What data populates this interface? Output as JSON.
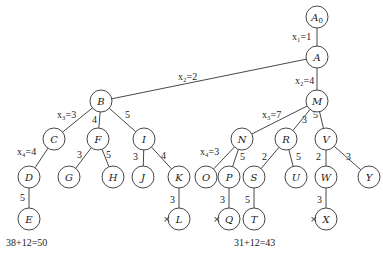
{
  "diagram": {
    "type": "search-tree",
    "nodes": [
      {
        "id": "A0",
        "label": "A",
        "sub": "0",
        "x": 317,
        "y": 17
      },
      {
        "id": "A",
        "label": "A",
        "x": 317,
        "y": 57
      },
      {
        "id": "B",
        "label": "B",
        "x": 101,
        "y": 101
      },
      {
        "id": "M",
        "label": "M",
        "x": 317,
        "y": 101
      },
      {
        "id": "C",
        "label": "C",
        "x": 54,
        "y": 139
      },
      {
        "id": "F",
        "label": "F",
        "x": 98,
        "y": 139
      },
      {
        "id": "I",
        "label": "I",
        "x": 144,
        "y": 139
      },
      {
        "id": "N",
        "label": "N",
        "x": 242,
        "y": 139
      },
      {
        "id": "R",
        "label": "R",
        "x": 286,
        "y": 139
      },
      {
        "id": "V",
        "label": "V",
        "x": 326,
        "y": 139
      },
      {
        "id": "D",
        "label": "D",
        "x": 29,
        "y": 177
      },
      {
        "id": "G",
        "label": "G",
        "x": 69,
        "y": 177
      },
      {
        "id": "H",
        "label": "H",
        "x": 113,
        "y": 177
      },
      {
        "id": "J",
        "label": "J",
        "x": 143,
        "y": 177
      },
      {
        "id": "K",
        "label": "K",
        "x": 179,
        "y": 177
      },
      {
        "id": "O",
        "label": "O",
        "x": 206,
        "y": 177
      },
      {
        "id": "P",
        "label": "P",
        "x": 229,
        "y": 177
      },
      {
        "id": "S",
        "label": "S",
        "x": 254,
        "y": 177
      },
      {
        "id": "U",
        "label": "U",
        "x": 296,
        "y": 177
      },
      {
        "id": "W",
        "label": "W",
        "x": 326,
        "y": 177
      },
      {
        "id": "Y",
        "label": "Y",
        "x": 369,
        "y": 177
      },
      {
        "id": "E",
        "label": "E",
        "x": 29,
        "y": 219
      },
      {
        "id": "L",
        "label": "L",
        "x": 179,
        "y": 219
      },
      {
        "id": "Q",
        "label": "Q",
        "x": 229,
        "y": 219
      },
      {
        "id": "T",
        "label": "T",
        "x": 254,
        "y": 219
      },
      {
        "id": "X",
        "label": "X",
        "x": 326,
        "y": 219
      }
    ],
    "edges": [
      {
        "from": "A0",
        "to": "A",
        "label": "x₁=1",
        "lx": 292,
        "ly": 40
      },
      {
        "from": "A",
        "to": "B",
        "label": "x₂=2",
        "lx": 178,
        "ly": 80
      },
      {
        "from": "A",
        "to": "M",
        "label": "x₂=4",
        "lx": 295,
        "ly": 84
      },
      {
        "from": "B",
        "to": "C",
        "label": "x₃=3",
        "lx": 57,
        "ly": 118
      },
      {
        "from": "B",
        "to": "F",
        "label": "4",
        "lx": 92,
        "ly": 123
      },
      {
        "from": "B",
        "to": "I",
        "label": "5",
        "lx": 125,
        "ly": 118
      },
      {
        "from": "M",
        "to": "N",
        "label": "x₃=7",
        "lx": 262,
        "ly": 118
      },
      {
        "from": "M",
        "to": "R",
        "label": "3",
        "lx": 302,
        "ly": 123
      },
      {
        "from": "M",
        "to": "V",
        "label": "5",
        "lx": 313,
        "ly": 118
      },
      {
        "from": "C",
        "to": "D",
        "label": "x₄=4",
        "lx": 17,
        "ly": 155
      },
      {
        "from": "F",
        "to": "G",
        "label": "3",
        "lx": 77,
        "ly": 158
      },
      {
        "from": "F",
        "to": "H",
        "label": "5",
        "lx": 106,
        "ly": 158
      },
      {
        "from": "I",
        "to": "J",
        "label": "3",
        "lx": 133,
        "ly": 160
      },
      {
        "from": "I",
        "to": "K",
        "label": "4",
        "lx": 161,
        "ly": 159
      },
      {
        "from": "N",
        "to": "O",
        "label": "x₄=3",
        "lx": 200,
        "ly": 155
      },
      {
        "from": "N",
        "to": "P",
        "label": "5",
        "lx": 240,
        "ly": 160
      },
      {
        "from": "R",
        "to": "S",
        "label": "2",
        "lx": 262,
        "ly": 160
      },
      {
        "from": "R",
        "to": "U",
        "label": "5",
        "lx": 296,
        "ly": 160
      },
      {
        "from": "V",
        "to": "W",
        "label": "2",
        "lx": 316,
        "ly": 160
      },
      {
        "from": "V",
        "to": "Y",
        "label": "3",
        "lx": 346,
        "ly": 160
      },
      {
        "from": "D",
        "to": "E",
        "label": "5",
        "lx": 20,
        "ly": 201
      },
      {
        "from": "K",
        "to": "L",
        "label": "3",
        "lx": 170,
        "ly": 203
      },
      {
        "from": "P",
        "to": "Q",
        "label": "3",
        "lx": 220,
        "ly": 203
      },
      {
        "from": "S",
        "to": "T",
        "label": "5",
        "lx": 245,
        "ly": 203
      },
      {
        "from": "W",
        "to": "X",
        "label": "3",
        "lx": 317,
        "ly": 203
      }
    ],
    "pruned": [
      {
        "node": "L",
        "mark": "×",
        "x": 163,
        "y": 222
      },
      {
        "node": "Q",
        "mark": "×",
        "x": 213,
        "y": 222
      },
      {
        "node": "X",
        "mark": "×",
        "x": 310,
        "y": 222
      }
    ],
    "costs": [
      {
        "node": "E",
        "text": "38+12=50",
        "x": 6,
        "y": 246
      },
      {
        "node": "T",
        "text": "31+12=43",
        "x": 234,
        "y": 246
      }
    ]
  }
}
